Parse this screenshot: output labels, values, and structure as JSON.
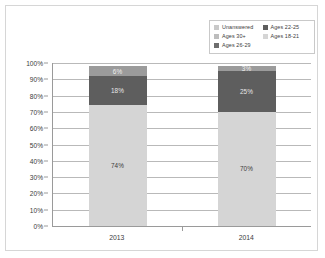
{
  "chart_data": {
    "type": "bar",
    "subtype": "100% stacked column",
    "title": "",
    "xlabel": "",
    "ylabel": "",
    "categories": [
      "2013",
      "2014"
    ],
    "ylim": [
      0,
      100
    ],
    "ytick_labels": [
      "100%",
      "90%",
      "80%",
      "70%",
      "60%",
      "50%",
      "40%",
      "30%",
      "20%",
      "10%",
      "0%"
    ],
    "ytick_values": [
      100,
      90,
      80,
      70,
      60,
      50,
      40,
      30,
      20,
      10,
      0
    ],
    "grid": true,
    "legend_position": "top-right",
    "series": [
      {
        "name": "Ages 18-21",
        "color": "#d5d5d5",
        "values": [
          74,
          70
        ],
        "labels": [
          "74%",
          "70%"
        ],
        "label_color": "#3b3b3b"
      },
      {
        "name": "Ages 22-25",
        "color": "#5e5e5e",
        "values": [
          18,
          25
        ],
        "labels": [
          "18%",
          "25%"
        ],
        "label_color": "#e8e8e8"
      },
      {
        "name": "Ages 26-29",
        "color": "#9b9b9b",
        "values": [
          6,
          3
        ],
        "labels": [
          "6%",
          "3%"
        ],
        "label_color": "#efefef"
      },
      {
        "name": "Ages 30+",
        "color": "#bdbdbd",
        "values": [
          0,
          0
        ],
        "labels": [
          "",
          ""
        ],
        "label_color": "#3b3b3b"
      },
      {
        "name": "Unanswered",
        "color": "#c9c9c9",
        "values": [
          0,
          0
        ],
        "labels": [
          "",
          ""
        ],
        "label_color": "#3b3b3b"
      }
    ]
  },
  "legend": {
    "items": [
      {
        "label": "Unanswered",
        "color": "#c9c9c9"
      },
      {
        "label": "Ages 22-25",
        "color": "#5e5e5e"
      },
      {
        "label": "Ages 30+",
        "color": "#bdbdbd"
      },
      {
        "label": "Ages 18-21",
        "color": "#d5d5d5"
      },
      {
        "label": "Ages 26-29",
        "color": "#6e6e6e"
      }
    ]
  },
  "colors": {
    "frame_border": "#d6d6d6",
    "axis_line": "#9a9a9a",
    "gridline": "#b9b9b9",
    "background": "#ffffff",
    "text": "#3b3b3b"
  }
}
